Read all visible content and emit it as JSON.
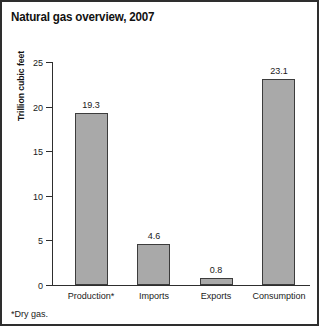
{
  "chart_data": {
    "type": "bar",
    "title": "Natural gas overview, 2007",
    "categories": [
      "Production*",
      "Imports",
      "Exports",
      "Consumption"
    ],
    "values": [
      19.3,
      4.6,
      0.8,
      23.1
    ],
    "value_labels": [
      "19.3",
      "4.6",
      "0.8",
      "23.1"
    ],
    "xlabel": "",
    "ylabel": "Trillion cubic feet",
    "ylim": [
      0,
      25
    ],
    "yticks": [
      0,
      5,
      10,
      15,
      20,
      25
    ],
    "ytick_labels": [
      "0",
      "5",
      "10",
      "15",
      "20",
      "25"
    ],
    "grid": false,
    "legend": false,
    "footnote": "*Dry gas.",
    "bar_color": "#a9a9a9",
    "bar_edge_color": "#3c3c3c",
    "axis_color": "#2e2e2e",
    "background_color": "#ffffff"
  }
}
